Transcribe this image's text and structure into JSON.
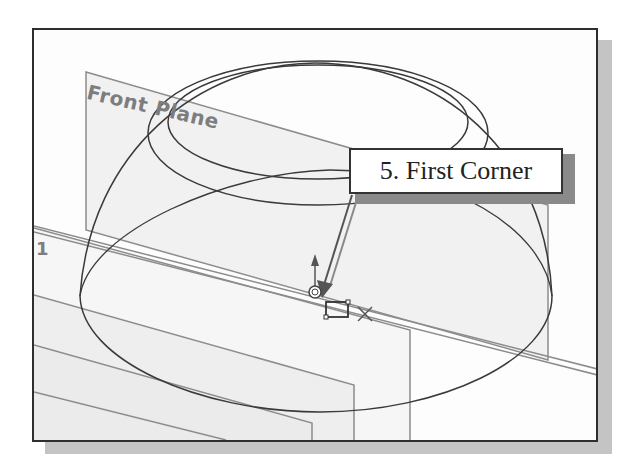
{
  "viewport": {
    "planes": [
      {
        "id": "front-plane",
        "label": "Front Plane"
      },
      {
        "id": "side-plane",
        "label": "1"
      }
    ]
  },
  "callout": {
    "step": "5.",
    "text": "5. First Corner"
  },
  "sketch_tools": {
    "cursor": "rectangle-cursor",
    "origin": "origin-icon"
  },
  "colors": {
    "frame_border": "#2e2e2e",
    "frame_shadow": "#c4c4c4",
    "geometry_line": "#3a3a3a",
    "plane_edge": "#8c8c8c",
    "plane_fill": "#f1f1f1",
    "plane_label": "#7d7d7d",
    "callout_border": "#333333"
  }
}
